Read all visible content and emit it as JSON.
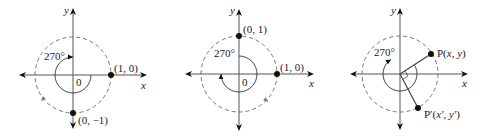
{
  "figure": {
    "panels": [
      {
        "id": "panel-1",
        "origin": [
          73,
          75
        ],
        "radius": 38,
        "x_axis": [
          19,
          147
        ],
        "y_axis": [
          8,
          129
        ],
        "axis_labels": {
          "x": "x",
          "y": "y"
        },
        "x_label_pos": [
          141,
          89
        ],
        "y_label_pos": [
          64,
          14
        ],
        "angle_label": "270°",
        "angle_label_pos": [
          44,
          60
        ],
        "origin_label": "0",
        "origin_label_pos": [
          76,
          86
        ],
        "rotation_arc": {
          "radius": 18,
          "start_deg": 0,
          "sweep_deg": -270,
          "direction": "counterclockwise-from-x"
        },
        "points": [
          {
            "label": "(1, 0)",
            "at": [
              111,
              75
            ],
            "label_pos": [
              114,
              72
            ]
          },
          {
            "label": "(0, −1)",
            "at": [
              73,
              113
            ],
            "label_pos": [
              78,
              124
            ]
          }
        ],
        "circle_tick_arrow": {
          "at": [
            43,
            99
          ],
          "angle": 130
        }
      },
      {
        "id": "panel-2",
        "origin": [
          239,
          74
        ],
        "radius": 38,
        "x_axis": [
          185,
          314
        ],
        "y_axis": [
          9,
          131
        ],
        "axis_labels": {
          "x": "x",
          "y": "y"
        },
        "x_label_pos": [
          309,
          87
        ],
        "y_label_pos": [
          230,
          14
        ],
        "angle_label": "270°",
        "angle_label_pos": [
          214,
          57
        ],
        "origin_label": "0",
        "origin_label_pos": [
          242,
          86
        ],
        "rotation_arc": {
          "radius": 18,
          "start_deg": 90,
          "sweep_deg": -270,
          "direction": "clockwise-from-y"
        },
        "points": [
          {
            "label": "(0, 1)",
            "at": [
              239,
              36
            ],
            "label_pos": [
              243,
              33
            ]
          },
          {
            "label": "(1, 0)",
            "at": [
              277,
              74
            ],
            "label_pos": [
              280,
              71
            ]
          }
        ],
        "circle_tick_arrow": {
          "at": [
            266,
            100
          ],
          "angle": 40
        }
      },
      {
        "id": "panel-3",
        "origin": [
          400,
          74
        ],
        "radius": 38,
        "x_axis": [
          350,
          468
        ],
        "y_axis": [
          8,
          130
        ],
        "axis_labels": {
          "x": "x",
          "y": "y"
        },
        "x_label_pos": [
          462,
          87
        ],
        "y_label_pos": [
          391,
          14
        ],
        "angle_label": "270°",
        "angle_label_pos": [
          374,
          56
        ],
        "rotation_arc": {
          "radius": 17,
          "start_deg": 32,
          "sweep_deg": -270
        },
        "points": [
          {
            "label_main": "P(",
            "label_vars": "x, y",
            "label_close": ")",
            "at": [
              431,
              54
            ],
            "label_pos": [
              437,
              57
            ]
          },
          {
            "label_main": "P′(",
            "label_vars": "x′, y′",
            "label_close": ")",
            "at": [
              418,
              108
            ],
            "label_pos": [
              424,
              118
            ]
          }
        ]
      }
    ]
  }
}
